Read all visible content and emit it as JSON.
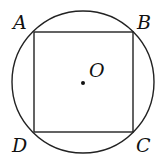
{
  "diagram": {
    "type": "inscribed-square-in-circle",
    "circle": {
      "center_label": "O",
      "cx": 83,
      "cy": 82,
      "r": 72
    },
    "square": {
      "vertices": [
        {
          "label": "A",
          "x": 34,
          "y": 32
        },
        {
          "label": "B",
          "x": 133,
          "y": 32
        },
        {
          "label": "C",
          "x": 133,
          "y": 132
        },
        {
          "label": "D",
          "x": 34,
          "y": 132
        }
      ]
    },
    "labels": {
      "A": "A",
      "B": "B",
      "C": "C",
      "D": "D",
      "O": "O"
    },
    "colors": {
      "stroke": "#222222",
      "background": "#ffffff"
    }
  }
}
